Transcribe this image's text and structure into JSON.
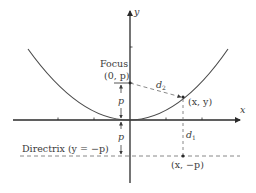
{
  "diagram": {
    "type": "parabola-focus-directrix",
    "axes": {
      "x_label": "x",
      "y_label": "y"
    },
    "labels": {
      "focus_title": "Focus",
      "focus_coords": "(0, p)",
      "point": "(x, y)",
      "directrix_point": "(x, −p)",
      "directrix": "Directrix (y = −p)",
      "d1": "d",
      "d1_sub": "1",
      "d2": "d",
      "d2_sub": "2",
      "p_upper": "p",
      "p_lower": "p"
    },
    "colors": {
      "curve": "#4a4a4a",
      "axis": "#2a2a2a",
      "dashed": "#6a6a6a",
      "text": "#3a3a3a"
    }
  }
}
